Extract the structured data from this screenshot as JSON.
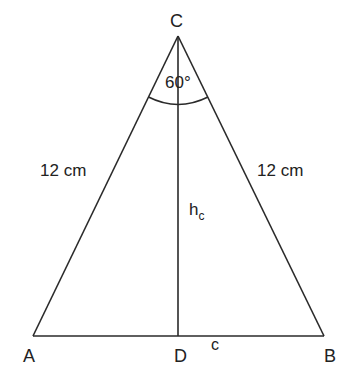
{
  "diagram": {
    "type": "isosceles triangle with altitude",
    "vertices": {
      "A": {
        "label": "A"
      },
      "B": {
        "label": "B"
      },
      "C": {
        "label": "C"
      },
      "D": {
        "label": "D"
      }
    },
    "angle_C": {
      "label": "60°"
    },
    "side_AC": {
      "label": "12 cm"
    },
    "side_BC": {
      "label": "12 cm"
    },
    "side_AB": {
      "label": "c"
    },
    "altitude": {
      "base": "h",
      "subscript": "c"
    }
  },
  "colors": {
    "stroke": "#2a2a2a",
    "background": "#ffffff"
  }
}
